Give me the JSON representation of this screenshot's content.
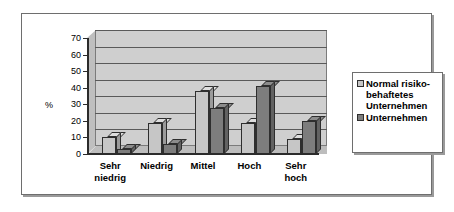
{
  "chart_data": {
    "type": "bar",
    "title": "",
    "xlabel": "",
    "ylabel": "%",
    "ylim": [
      0,
      70
    ],
    "yticks": [
      0,
      10,
      20,
      30,
      40,
      50,
      60,
      70
    ],
    "grid": true,
    "legend_position": "right",
    "categories": [
      "Sehr\nniedrig",
      "Niedrig",
      "Mittel",
      "Hoch",
      "Sehr\nhoch"
    ],
    "series": [
      {
        "name": "Normal risiko-\nbehaftetes\nUnternehmen",
        "color": "#c6c6c6",
        "values": [
          10,
          19,
          38,
          19,
          9
        ]
      },
      {
        "name": "Unternehmen",
        "color": "#7d7d7d",
        "values": [
          3,
          6,
          28,
          41,
          20
        ]
      }
    ]
  },
  "axis": {
    "unit_label": "%",
    "tick_labels": [
      "70",
      "60",
      "50",
      "40",
      "30",
      "20",
      "10",
      "0"
    ]
  },
  "legend": {
    "entries": [
      {
        "label": "Normal risiko-\nbehaftetes\nUnternehmen",
        "swatch_color": "#c6c6c6"
      },
      {
        "label": "Unternehmen",
        "swatch_color": "#7d7d7d"
      }
    ]
  },
  "colors": {
    "plot_background": "#cfcfcf",
    "frame_border": "#6e6e6e",
    "gridline": "#5a5a5a",
    "axis": "#2b2b2b",
    "series_light": "#c6c6c6",
    "series_dark": "#7d7d7d"
  }
}
